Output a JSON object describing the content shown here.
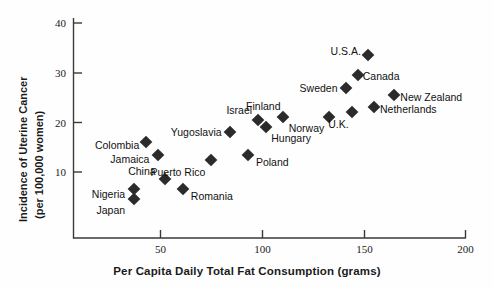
{
  "chart_data": {
    "type": "scatter",
    "title": "",
    "xlabel": "Per Capita Daily Total Fat Consumption (grams)",
    "ylabel": "Incidence of Uterine Cancer (per 100,000 women)",
    "ylabel_line1": "Incidence of Uterine Cancer",
    "ylabel_line2": "(per 100,000 women)",
    "xlim": [
      8,
      205
    ],
    "ylim": [
      0,
      40
    ],
    "xticks": [
      50,
      100,
      150,
      200
    ],
    "yticks": [
      10,
      20,
      30,
      40
    ],
    "grid": false,
    "legend": "none",
    "marker": "diamond",
    "marker_color": "#2b2b2b",
    "points": [
      {
        "label": "Japan",
        "x": 37,
        "y": 4.5,
        "label_side": "left",
        "label_dx": -9,
        "label_dy": 11
      },
      {
        "label": "Nigeria",
        "x": 37,
        "y": 6.5,
        "label_side": "left",
        "label_dx": -9,
        "label_dy": 5
      },
      {
        "label": "Colombia",
        "x": 43,
        "y": 16,
        "label_side": "left",
        "label_dx": -7,
        "label_dy": 3
      },
      {
        "label": "Jamaica",
        "x": 49,
        "y": 13.5,
        "label_side": "left",
        "label_dx": -9,
        "label_dy": 4
      },
      {
        "label": "China",
        "x": 52,
        "y": 8.5,
        "label_side": "left",
        "label_dx": -9,
        "label_dy": -8
      },
      {
        "label": "Romania",
        "x": 61,
        "y": 6.5,
        "label_side": "right",
        "label_dx": 8,
        "label_dy": 7
      },
      {
        "label": "Puerto Rico",
        "x": 75,
        "y": 12.5,
        "label_side": "left",
        "label_dx": -6,
        "label_dy": 12
      },
      {
        "label": "Yugoslavia",
        "x": 84,
        "y": 18,
        "label_side": "left",
        "label_dx": -8,
        "label_dy": 0
      },
      {
        "label": "Poland",
        "x": 93,
        "y": 13.5,
        "label_side": "right",
        "label_dx": 8,
        "label_dy": 7
      },
      {
        "label": "Israel",
        "x": 98,
        "y": 20.5,
        "label_side": "left",
        "label_dx": -6,
        "label_dy": -10
      },
      {
        "label": "Hungary",
        "x": 102,
        "y": 19,
        "label_side": "right",
        "label_dx": 5,
        "label_dy": 11
      },
      {
        "label": "Finland",
        "x": 110,
        "y": 21,
        "label_side": "left",
        "label_dx": -2,
        "label_dy": -11
      },
      {
        "label": "Norway",
        "x": 133,
        "y": 21,
        "label_side": "left",
        "label_dx": -5,
        "label_dy": 11
      },
      {
        "label": "U.K.",
        "x": 144,
        "y": 22,
        "label_side": "left",
        "label_dx": -3,
        "label_dy": 12
      },
      {
        "label": "Sweden",
        "x": 141,
        "y": 27,
        "label_side": "left",
        "label_dx": -8,
        "label_dy": 0
      },
      {
        "label": "Canada",
        "x": 147,
        "y": 29.5,
        "label_side": "right",
        "label_dx": 5,
        "label_dy": 1
      },
      {
        "label": "U.S.A.",
        "x": 152,
        "y": 33.5,
        "label_side": "left",
        "label_dx": -7,
        "label_dy": -4
      },
      {
        "label": "Netherlands",
        "x": 155,
        "y": 23,
        "label_side": "right",
        "label_dx": 6,
        "label_dy": 2
      },
      {
        "label": "New Zealand",
        "x": 165,
        "y": 25.5,
        "label_side": "right",
        "label_dx": 6,
        "label_dy": 2
      }
    ]
  }
}
